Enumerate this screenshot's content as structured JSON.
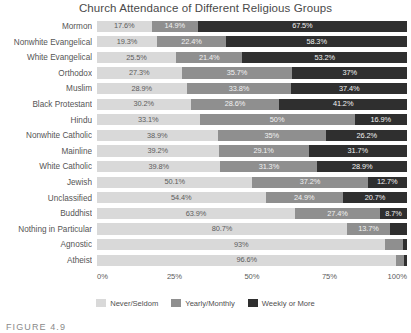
{
  "caption": "FIGURE 4.9",
  "colors": {
    "never_seldom": "#d9d9d9",
    "yearly_monthly": "#8f8f8f",
    "weekly_or_more": "#2f2f2f",
    "text": "#4f4f4f",
    "background": "#ffffff"
  },
  "legend": {
    "position": "bottom",
    "entries": [
      {
        "label": "Never/Seldom",
        "color": "#d9d9d9"
      },
      {
        "label": "Yearly/Monthly",
        "color": "#8f8f8f"
      },
      {
        "label": "Weekly or More",
        "color": "#2f2f2f"
      }
    ]
  },
  "chart_data": {
    "type": "bar",
    "orientation": "horizontal",
    "stacked": true,
    "normalized": true,
    "title": "Church Attendance of Different Religious Groups",
    "xlabel": "",
    "ylabel": "",
    "xlim": [
      0,
      100
    ],
    "grid": false,
    "xticks": [
      "0%",
      "25%",
      "50%",
      "75%",
      "100%"
    ],
    "xtick_values": [
      0,
      25,
      50,
      75,
      100
    ],
    "categories": [
      "Mormon",
      "Nonwhite Evangelical",
      "White Evangelical",
      "Orthodox",
      "Muslim",
      "Black Protestant",
      "Hindu",
      "Nonwhite Catholic",
      "Mainline",
      "White Catholic",
      "Jewish",
      "Unclassified",
      "Buddhist",
      "Nothing in Particular",
      "Agnostic",
      "Atheist"
    ],
    "series": [
      {
        "name": "Never/Seldom",
        "color": "#d9d9d9",
        "values": [
          17.6,
          19.3,
          25.5,
          27.3,
          28.9,
          30.2,
          33.1,
          38.9,
          39.2,
          39.8,
          50.1,
          54.4,
          63.9,
          80.7,
          93.0,
          96.6
        ],
        "labels": [
          "17.6%",
          "19.3%",
          "25.5%",
          "27.3%",
          "28.9%",
          "30.2%",
          "33.1%",
          "38.9%",
          "39.2%",
          "39.8%",
          "50.1%",
          "54.4%",
          "63.9%",
          "80.7%",
          "93%",
          "96.6%"
        ]
      },
      {
        "name": "Yearly/Monthly",
        "color": "#8f8f8f",
        "values": [
          14.9,
          22.4,
          21.4,
          35.7,
          33.8,
          28.6,
          50.0,
          35.0,
          29.1,
          31.3,
          37.2,
          24.9,
          27.4,
          13.7,
          5.6,
          2.4
        ],
        "labels": [
          "14.9%",
          "22.4%",
          "21.4%",
          "35.7%",
          "33.8%",
          "28.6%",
          "50%",
          "35%",
          "29.1%",
          "31.3%",
          "37.2%",
          "24.9%",
          "27.4%",
          "13.7%",
          "",
          ""
        ]
      },
      {
        "name": "Weekly or More",
        "color": "#2f2f2f",
        "values": [
          67.5,
          58.3,
          53.2,
          37.0,
          37.4,
          41.2,
          16.9,
          26.2,
          31.7,
          28.9,
          12.7,
          20.7,
          8.7,
          5.6,
          1.4,
          1.0
        ],
        "labels": [
          "67.5%",
          "58.3%",
          "53.2%",
          "37%",
          "37.4%",
          "41.2%",
          "16.9%",
          "26.2%",
          "31.7%",
          "28.9%",
          "12.7%",
          "20.7%",
          "8.7%",
          "",
          "",
          ""
        ]
      }
    ]
  }
}
